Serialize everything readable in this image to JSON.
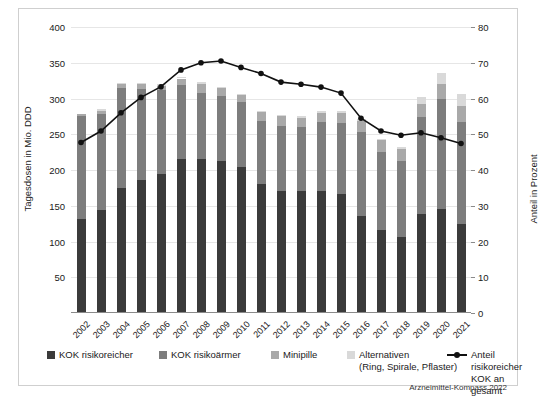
{
  "chart_data": {
    "type": "bar",
    "title": "",
    "subtitle": "",
    "xlabel": "",
    "ylabel": "Tagesdosen in Mio. DDD",
    "ylabel_secondary": "Anteil in Prozent",
    "ylim": [
      0,
      400
    ],
    "ylim_secondary": [
      0,
      80
    ],
    "yticks": [
      0,
      50,
      100,
      150,
      200,
      250,
      300,
      350,
      400
    ],
    "yticks_secondary": [
      0,
      10,
      20,
      30,
      40,
      50,
      60,
      70,
      80
    ],
    "ytick_labels": [
      "",
      "50",
      "100",
      "150",
      "200",
      "250",
      "300",
      "350",
      "400"
    ],
    "ytick_labels_secondary": [
      "0",
      "10",
      "20",
      "30",
      "40",
      "50",
      "60",
      "70",
      "80"
    ],
    "grid": true,
    "stacked": true,
    "legend_position": "bottom",
    "categories": [
      "2002",
      "2003",
      "2004",
      "2005",
      "2006",
      "2007",
      "2008",
      "2009",
      "2010",
      "2011",
      "2012",
      "2013",
      "2014",
      "2015",
      "2016",
      "2017",
      "2018",
      "2019",
      "2020",
      "2021"
    ],
    "series": [
      {
        "name": "KOK risikoreicher",
        "color": "#3b3b3b",
        "values": [
          132,
          144,
          175,
          186,
          195,
          215,
          216,
          213,
          204,
          181,
          171,
          170,
          171,
          166,
          135,
          116,
          106,
          138,
          145,
          125
        ]
      },
      {
        "name": "KOK risikoärmer",
        "color": "#7d7d7d",
        "values": [
          144,
          135,
          140,
          128,
          117,
          104,
          92,
          90,
          91,
          88,
          91,
          90,
          96,
          100,
          118,
          109,
          106,
          136,
          155,
          142
        ]
      },
      {
        "name": "Minipille",
        "color": "#a9a9a9",
        "values": [
          2,
          4,
          5,
          6,
          6,
          9,
          13,
          12,
          11,
          12,
          13,
          13,
          13,
          14,
          16,
          17,
          18,
          19,
          21,
          23
        ]
      },
      {
        "name": "Alternativen (Ring, Spirale, Pflaster)",
        "color": "#d9d9d9",
        "values": [
          0,
          3,
          2,
          2,
          2,
          2,
          2,
          1,
          1,
          2,
          2,
          2,
          2,
          2,
          2,
          2,
          2,
          9,
          15,
          16
        ]
      }
    ],
    "line_series": {
      "name": "Anteil risikoreicher KOK an gesamt",
      "color": "#111111",
      "axis": "secondary",
      "unit": "%",
      "values": [
        47.7,
        50.9,
        56.0,
        60.3,
        63.3,
        68.0,
        70.0,
        70.5,
        68.7,
        67.0,
        64.6,
        64.0,
        63.2,
        61.5,
        54.5,
        50.9,
        49.7,
        50.4,
        49.0,
        47.4
      ]
    }
  },
  "legend": {
    "items": [
      {
        "label": "KOK risikoreicher",
        "color": "#3b3b3b"
      },
      {
        "label": "KOK risikoärmer",
        "color": "#7d7d7d"
      },
      {
        "label": "Minipille",
        "color": "#a9a9a9"
      },
      {
        "label": "Alternativen\n(Ring, Spirale, Pflaster)",
        "color": "#d9d9d9"
      }
    ],
    "line_label": "Anteil risikoreicher\nKOK an gesamt"
  },
  "source": "Arzneimittel-Kompass 2022"
}
